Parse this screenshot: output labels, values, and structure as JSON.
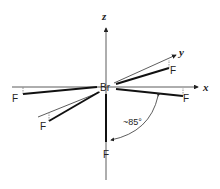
{
  "diagram": {
    "central_atom": "Br",
    "ligand_label": "F",
    "axes": {
      "x": "x",
      "y": "y",
      "z": "z"
    },
    "angle_label": "~85°",
    "colors": {
      "line": "#222222",
      "background": "#ffffff"
    }
  }
}
